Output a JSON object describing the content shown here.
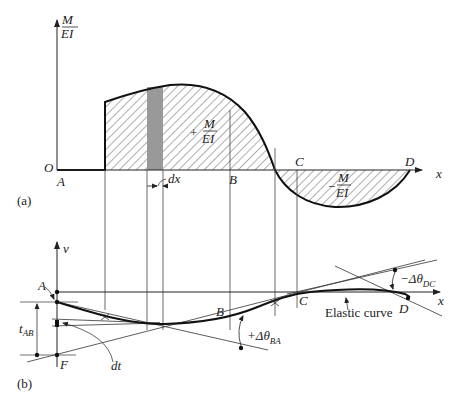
{
  "figure": {
    "panel_a": {
      "label": "(a)",
      "y_axis_label_num": "M",
      "y_axis_label_den": "EI",
      "origin_label": "O",
      "x_axis_label": "x",
      "points": {
        "A": "A",
        "B": "B",
        "C": "C",
        "D": "D"
      },
      "positive_area_sign": "+",
      "positive_area_num": "M",
      "positive_area_den": "EI",
      "negative_area_sign": "−",
      "negative_area_num": "M",
      "negative_area_den": "EI",
      "strip_label": "dx"
    },
    "panel_b": {
      "label": "(b)",
      "y_axis_label": "v",
      "x_axis_label": "x",
      "points": {
        "A": "A",
        "B": "B",
        "C": "C",
        "D": "D",
        "F": "F"
      },
      "tangential_deviation": "t",
      "tangential_deviation_sub": "AB",
      "increment_label": "dt",
      "angle_ba": "+Δθ",
      "angle_ba_sub": "BA",
      "angle_dc": "−Δθ",
      "angle_dc_sub": "DC",
      "curve_label": "Elastic curve"
    }
  }
}
